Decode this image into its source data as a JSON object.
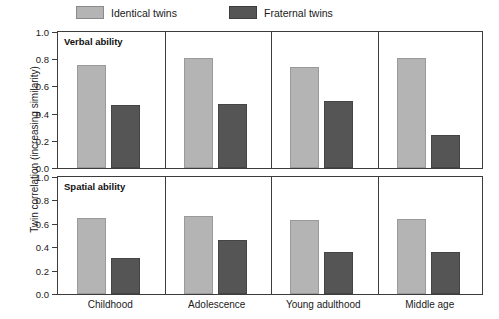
{
  "chart_data": {
    "type": "bar",
    "title": "",
    "xlabel": "",
    "ylabel": "Twin correlation (increasing similarity)",
    "ylim": [
      0.0,
      1.0
    ],
    "ytick_labels": [
      "1.0",
      "0.8",
      "0.6",
      "0.4",
      "0.2",
      "0.0"
    ],
    "ytick_values": [
      1.0,
      0.8,
      0.6,
      0.4,
      0.2,
      0.0
    ],
    "grid": false,
    "legend_position": "top",
    "categories": [
      "Childhood",
      "Adolescence",
      "Young adulthood",
      "Middle age"
    ],
    "legend": [
      "Identical twins",
      "Fraternal twins"
    ],
    "panels": [
      {
        "name": "Verbal ability",
        "series": [
          {
            "name": "Identical twins",
            "color": "#b4b4b4",
            "values": [
              0.76,
              0.81,
              0.74,
              0.81
            ]
          },
          {
            "name": "Fraternal twins",
            "color": "#555555",
            "values": [
              0.46,
              0.47,
              0.49,
              0.24
            ]
          }
        ]
      },
      {
        "name": "Spatial ability",
        "series": [
          {
            "name": "Identical twins",
            "color": "#b4b4b4",
            "values": [
              0.65,
              0.67,
              0.63,
              0.64
            ]
          },
          {
            "name": "Fraternal twins",
            "color": "#555555",
            "values": [
              0.31,
              0.46,
              0.36,
              0.36
            ]
          }
        ]
      }
    ]
  }
}
